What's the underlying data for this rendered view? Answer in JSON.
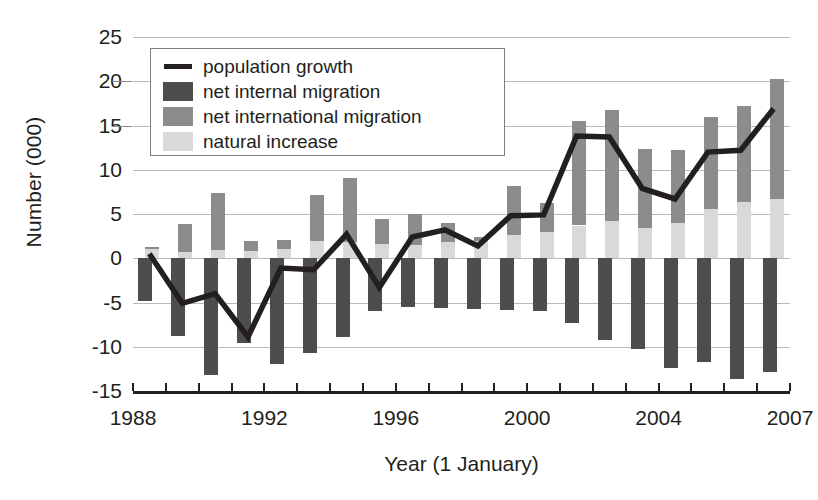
{
  "chart_data": {
    "type": "bar",
    "title": "",
    "xlabel": "Year (1 January)",
    "ylabel": "Number (000)",
    "ylim": [
      -15,
      25
    ],
    "ytick_values": [
      25,
      20,
      15,
      10,
      5,
      0,
      -5,
      -10,
      -15
    ],
    "ytick_labels": [
      "25",
      "20",
      "15",
      "10",
      "5",
      "0",
      "-5",
      "-10",
      "-15"
    ],
    "grid": true,
    "legend_position": "upper left",
    "categories": [
      1988,
      1989,
      1990,
      1991,
      1992,
      1993,
      1994,
      1995,
      1996,
      1997,
      1998,
      1999,
      2000,
      2001,
      2002,
      2003,
      2004,
      2005,
      2006,
      2007
    ],
    "xtick_labels": [
      "1988",
      "1992",
      "1996",
      "2000",
      "2004",
      "2007"
    ],
    "xtick_values": [
      1988,
      1992,
      1996,
      2000,
      2004,
      2007
    ],
    "series": [
      {
        "name": "natural increase",
        "type": "bar-stacked-positive",
        "color": "#d9d9d9",
        "values": [
          1.1,
          0.7,
          0.9,
          0.8,
          1.1,
          2.0,
          1.8,
          1.6,
          1.5,
          1.8,
          2.0,
          2.6,
          3.0,
          3.7,
          4.2,
          3.4,
          4.0,
          5.6,
          6.4,
          6.7
        ]
      },
      {
        "name": "net international migration",
        "type": "bar-stacked-positive",
        "color": "#8c8c8c",
        "values": [
          0.2,
          3.2,
          6.5,
          1.2,
          1.0,
          5.2,
          7.3,
          2.8,
          3.5,
          2.2,
          0.4,
          5.6,
          3.2,
          11.8,
          12.5,
          8.9,
          8.2,
          10.4,
          10.8,
          13.6
        ]
      },
      {
        "name": "net internal migration",
        "type": "bar-negative",
        "color": "#4d4d4d",
        "values": [
          -4.8,
          -8.8,
          -13.2,
          -9.6,
          -12.0,
          -10.7,
          -8.9,
          -6.0,
          -5.5,
          -5.6,
          -5.7,
          -5.9,
          -6.0,
          -7.3,
          -9.2,
          -10.2,
          -12.4,
          -11.7,
          -13.6,
          -12.9
        ]
      },
      {
        "name": "population growth",
        "type": "line",
        "color": "#231f20",
        "values": [
          0.5,
          -5.1,
          -4.0,
          -8.9,
          -1.1,
          -1.3,
          2.7,
          -3.3,
          2.4,
          3.2,
          1.4,
          4.8,
          4.9,
          13.8,
          13.7,
          7.9,
          6.7,
          12.0,
          12.2,
          16.9
        ]
      }
    ]
  },
  "legend": {
    "items": [
      {
        "label": "population growth",
        "swatch": "line",
        "color": "#231f20"
      },
      {
        "label": "net internal migration",
        "swatch": "box",
        "color": "#4d4d4d"
      },
      {
        "label": "net international migration",
        "swatch": "box",
        "color": "#8c8c8c"
      },
      {
        "label": "natural increase",
        "swatch": "box",
        "color": "#d9d9d9"
      }
    ]
  }
}
